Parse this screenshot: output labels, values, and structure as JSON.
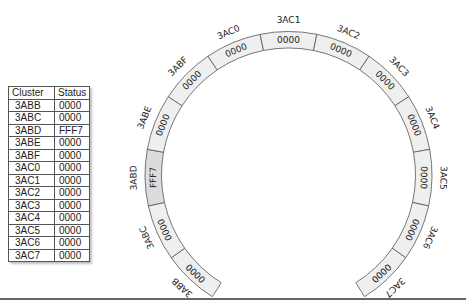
{
  "table": {
    "headers": [
      "Cluster",
      "Status"
    ],
    "rows": [
      {
        "cluster": "3ABB",
        "status": "0000"
      },
      {
        "cluster": "3ABC",
        "status": "0000"
      },
      {
        "cluster": "3ABD",
        "status": "FFF7"
      },
      {
        "cluster": "3ABE",
        "status": "0000"
      },
      {
        "cluster": "3ABF",
        "status": "0000"
      },
      {
        "cluster": "3AC0",
        "status": "0000"
      },
      {
        "cluster": "3AC1",
        "status": "0000"
      },
      {
        "cluster": "3AC2",
        "status": "0000"
      },
      {
        "cluster": "3AC3",
        "status": "0000"
      },
      {
        "cluster": "3AC4",
        "status": "0000"
      },
      {
        "cluster": "3AC5",
        "status": "0000"
      },
      {
        "cluster": "3AC6",
        "status": "0000"
      },
      {
        "cluster": "3AC7",
        "status": "0000"
      }
    ]
  },
  "ring": {
    "segments": [
      {
        "cluster": "3ABB",
        "status": "0000"
      },
      {
        "cluster": "3ABC",
        "status": "0000"
      },
      {
        "cluster": "3ABD",
        "status": "FFF7"
      },
      {
        "cluster": "3ABE",
        "status": "0000"
      },
      {
        "cluster": "3ABF",
        "status": "0000"
      },
      {
        "cluster": "3AC0",
        "status": "0000"
      },
      {
        "cluster": "3AC1",
        "status": "0000"
      },
      {
        "cluster": "3AC2",
        "status": "0000"
      },
      {
        "cluster": "3AC3",
        "status": "0000"
      },
      {
        "cluster": "3AC4",
        "status": "0000"
      },
      {
        "cluster": "3AC5",
        "status": "0000"
      },
      {
        "cluster": "3AC6",
        "status": "0000"
      },
      {
        "cluster": "3AC7",
        "status": "0000"
      }
    ],
    "colors": {
      "normal_fill": "#efefef",
      "flagged_fill": "#dcdcdc",
      "stroke": "#555555"
    }
  }
}
